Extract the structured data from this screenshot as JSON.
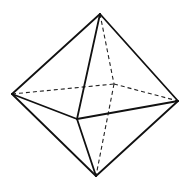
{
  "figure": {
    "background": "#ffffff",
    "stroke_color": "#111111",
    "vertices": {
      "top": [
        100,
        14
      ],
      "left": [
        12,
        94
      ],
      "right": [
        178,
        101
      ],
      "bottom": [
        96,
        176
      ],
      "front": [
        77,
        119
      ],
      "back": [
        114,
        84
      ]
    },
    "visible_edges": [
      [
        "top",
        "left"
      ],
      [
        "top",
        "right"
      ],
      [
        "top",
        "front"
      ],
      [
        "left",
        "front"
      ],
      [
        "front",
        "right"
      ],
      [
        "left",
        "bottom"
      ],
      [
        "right",
        "bottom"
      ],
      [
        "front",
        "bottom"
      ]
    ],
    "hidden_edges": [
      [
        "left",
        "back"
      ],
      [
        "back",
        "right"
      ],
      [
        "top",
        "back"
      ],
      [
        "back",
        "bottom"
      ]
    ]
  }
}
